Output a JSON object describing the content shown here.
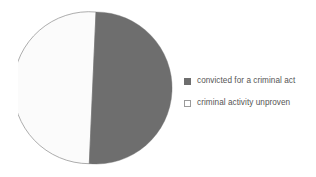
{
  "chart_data": {
    "type": "pie",
    "title": "",
    "categories": [
      "convicted for a criminal act",
      "criminal activity unproven"
    ],
    "values": [
      51.5,
      48.5
    ],
    "units": "percent",
    "colors": [
      "#6e6e6e",
      "#fbfbfb"
    ],
    "slice_border_color": "#8a8a8a",
    "start_angle_deg": 0,
    "direction": "clockwise",
    "legend": {
      "position": "right",
      "entries": [
        {
          "label": "convicted for a criminal act",
          "swatch": "filled-square",
          "color": "#6e6e6e",
          "value": 51.5
        },
        {
          "label": "criminal activity unproven",
          "swatch": "hollow-square",
          "color": "#ffffff",
          "value": 48.5
        }
      ]
    },
    "grid": false,
    "xlabel": "",
    "ylabel": ""
  },
  "figure": {
    "background_color": "#ffffff",
    "text_color": "#555555"
  },
  "pie": {
    "center_x": 78,
    "center_y": 82,
    "radius": 76,
    "slice_dark_path": "M 78 6 A 76 76 0 1 1 71.3 157.7 Z",
    "slice_light_path": "M 78 6 A 76 76 0 1 0 71.3 157.7 Z"
  }
}
